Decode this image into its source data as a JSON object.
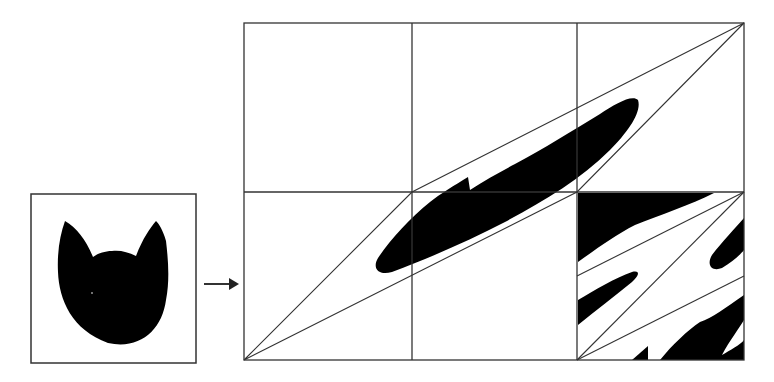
{
  "figure": {
    "colors": {
      "background": "#ffffff",
      "line": "#333333",
      "fill": "#000000"
    },
    "source_panel": {
      "label": "original-square",
      "shape": "cat-head-silhouette"
    },
    "arrow": {
      "direction": "right"
    },
    "target_panel": {
      "label": "transformed-grid",
      "grid_columns": 3,
      "grid_rows": 2,
      "shape": "sheared-cat-parallelogram"
    }
  }
}
